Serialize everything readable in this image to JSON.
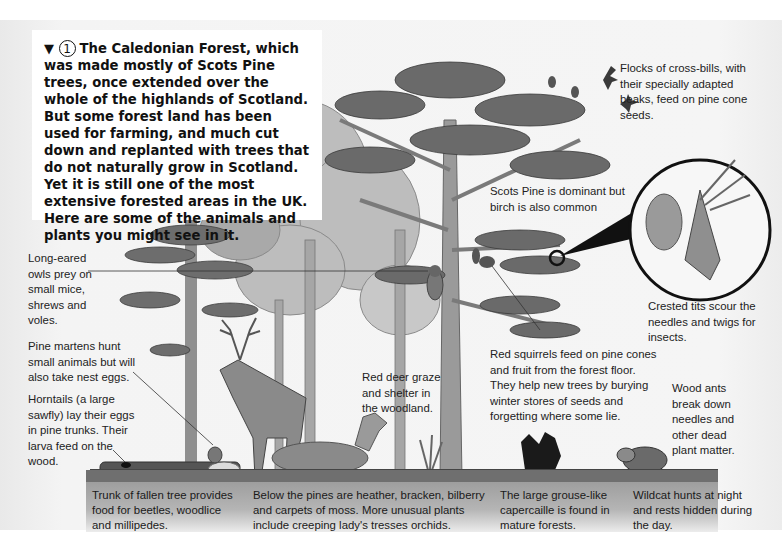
{
  "intro": {
    "marker_symbol": "▼",
    "number": "1",
    "text": "The Caledonian Forest, which was made mostly of Scots Pine trees, once extended over the whole of the highlands of Scotland. But some forest land has been used for farming, and much cut down and replanted with trees that do not naturally grow in Scotland. Yet it is still one of the most extensive forested areas in the UK. Here are some of the animals and plants you might see in it."
  },
  "labels": {
    "crossbills": "Flocks of cross-bills, with their specially adapted beaks, feed on pine cone seeds.",
    "scots_pine": "Scots Pine is dominant but birch is also common",
    "crested_tits": "Crested tits scour the needles and twigs for insects.",
    "owls": "Long-eared owls prey on small mice, shrews and voles.",
    "pine_martens": "Pine martens hunt small animals but will also take nest eggs.",
    "horntails": "Horntails (a large sawfly) lay their eggs in pine trunks. Their larva feed on the wood.",
    "red_deer": "Red deer graze and shelter in the woodland.",
    "red_squirrels": "Red squirrels feed on pine cones and fruit from the forest floor. They help new trees by burying winter stores of seeds and forgetting where some lie.",
    "wood_ants": "Wood ants break down needles and other dead plant matter."
  },
  "captions": [
    "Trunk of fallen tree provides food for beetles, woodlice and millipedes.",
    "Below the pines are heather, bracken, bilberry and carpets of moss. More unusual plants include creeping lady's tresses orchids.",
    "The large grouse-like capercaille is found in mature forests.",
    "Wildcat hunts at night and rests hidden during the day."
  ],
  "colors": {
    "background": "#ffffff",
    "page": "#f2f2f2",
    "foliage_dark": "#5a5a5a",
    "foliage_mid": "#8a8a8a",
    "foliage_light": "#b8b8b8",
    "trunk": "#8c8c8c",
    "ground": "#6f6f6f",
    "caption_strip": "#a8a8a8"
  }
}
